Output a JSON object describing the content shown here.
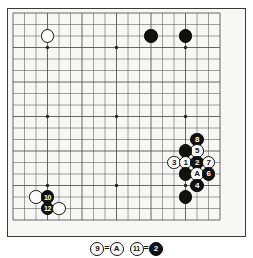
{
  "figure": {
    "type": "go-board-diagram",
    "board": {
      "size": 19,
      "origin_x": 13,
      "origin_y": 13,
      "spacing": 11.5,
      "background_color": "#f7f7f5",
      "line_color": "#555555",
      "border_color": "#3a3a3a",
      "star_points": [
        {
          "col": 3,
          "row": 3
        },
        {
          "col": 9,
          "row": 3
        },
        {
          "col": 15,
          "row": 3
        },
        {
          "col": 3,
          "row": 9
        },
        {
          "col": 9,
          "row": 9
        },
        {
          "col": 15,
          "row": 9
        },
        {
          "col": 3,
          "row": 15
        },
        {
          "col": 9,
          "row": 15
        },
        {
          "col": 15,
          "row": 15
        }
      ]
    },
    "colors": {
      "black_stone": "#111111",
      "white_stone": "#fdfdfd",
      "black_label": "#ffffff",
      "white_label": "#111111"
    },
    "stones": [
      {
        "name": "white-stone-upper-left",
        "color": "white",
        "label": "",
        "col": 3,
        "row": 2
      },
      {
        "name": "black-stone-top-right-a",
        "color": "black",
        "label": "",
        "col": 12,
        "row": 2
      },
      {
        "name": "black-stone-top-right-b",
        "color": "black",
        "label": "",
        "col": 15,
        "row": 2
      },
      {
        "name": "black-stone-8",
        "color": "black",
        "label": "8",
        "col": 16,
        "row": 11
      },
      {
        "name": "white-stone-5",
        "color": "white",
        "label": "5",
        "col": 16,
        "row": 12
      },
      {
        "name": "black-stone-wall-upper",
        "color": "black",
        "label": "",
        "col": 15,
        "row": 12
      },
      {
        "name": "white-stone-3",
        "color": "white",
        "label": "3",
        "col": 14,
        "row": 13
      },
      {
        "name": "white-stone-1",
        "color": "white",
        "label": "1",
        "col": 15,
        "row": 13
      },
      {
        "name": "black-stone-2",
        "color": "black",
        "label": "2",
        "col": 16,
        "row": 13
      },
      {
        "name": "white-stone-7",
        "color": "white",
        "label": "7",
        "col": 17,
        "row": 13
      },
      {
        "name": "black-stone-wall-lower",
        "color": "black",
        "label": "",
        "col": 15,
        "row": 14
      },
      {
        "name": "white-stone-a",
        "color": "white",
        "label": "A",
        "col": 16,
        "row": 14
      },
      {
        "name": "black-stone-6",
        "color": "black",
        "label": "6",
        "col": 17,
        "row": 14
      },
      {
        "name": "black-stone-4",
        "color": "black",
        "label": "4",
        "col": 16,
        "row": 15
      },
      {
        "name": "black-stone-bottom-right",
        "color": "black",
        "label": "",
        "col": 15,
        "row": 16
      },
      {
        "name": "white-stone-lower-left-a",
        "color": "white",
        "label": "",
        "col": 2,
        "row": 16
      },
      {
        "name": "black-stone-10",
        "color": "black",
        "label": "10",
        "col": 3,
        "row": 16
      },
      {
        "name": "black-stone-12",
        "color": "black",
        "label": "12",
        "col": 3,
        "row": 17
      },
      {
        "name": "white-stone-lower-left-b",
        "color": "white",
        "label": "",
        "col": 4,
        "row": 17
      }
    ],
    "caption": {
      "name": "move-equivalence-caption",
      "items": [
        {
          "stone_color": "white",
          "stone_label": "9",
          "equals_color": "white",
          "equals_label": "A",
          "separator": "="
        },
        {
          "stone_color": "white",
          "stone_label": "11",
          "equals_color": "black",
          "equals_label": "2",
          "separator": "="
        }
      ]
    }
  }
}
